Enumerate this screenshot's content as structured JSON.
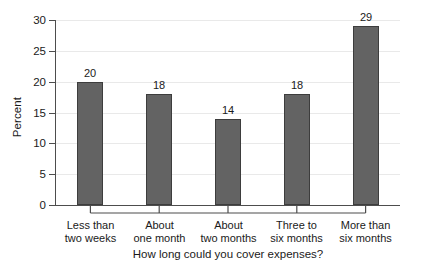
{
  "chart_data": {
    "type": "bar",
    "title": "",
    "xlabel": "How long could you cover expenses?",
    "ylabel": "Percent",
    "categories": [
      "Less than two weeks",
      "About one month",
      "About two months",
      "Three to six months",
      "More than six months"
    ],
    "category_lines": [
      [
        "Less than",
        "two weeks"
      ],
      [
        "About",
        "one month"
      ],
      [
        "About",
        "two months"
      ],
      [
        "Three to",
        "six months"
      ],
      [
        "More than",
        "six months"
      ]
    ],
    "values": [
      20,
      18,
      14,
      18,
      29
    ],
    "value_labels": [
      "20",
      "18",
      "14",
      "18",
      "29"
    ],
    "ylim": [
      0,
      30
    ],
    "yticks": [
      0,
      5,
      10,
      15,
      20,
      25,
      30
    ],
    "ytick_labels": [
      "0",
      "5",
      "10",
      "15",
      "20",
      "25",
      "30"
    ],
    "grid": true,
    "grid_axis": "y",
    "legend": false,
    "bar_color": "#636363",
    "bar_edge_color": "#3d3d3d",
    "gridline_color": "#e9e9e9",
    "axis_color": "#4d4d4d",
    "background": "#ffffff"
  }
}
